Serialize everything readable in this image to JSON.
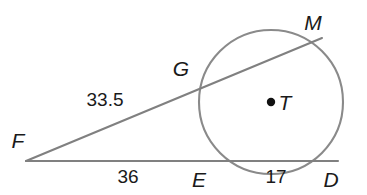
{
  "figure": {
    "type": "geometry-diagram",
    "background_color": "#ffffff",
    "line_color": "#808080",
    "circle_color": "#8a8a8a",
    "label_color": "#1a1a1a",
    "circle": {
      "center_label": "T",
      "center_x": 271,
      "center_y": 102,
      "radius": 72
    },
    "points": [
      {
        "id": "F",
        "label": "F",
        "x": 26,
        "y": 161,
        "label_x": 18,
        "label_y": 148
      },
      {
        "id": "G",
        "label": "G",
        "x": 201,
        "y": 83,
        "label_x": 181,
        "label_y": 76
      },
      {
        "id": "M",
        "label": "M",
        "x": 322,
        "y": 38,
        "label_x": 313,
        "label_y": 30
      },
      {
        "id": "E",
        "label": "E",
        "x": 214,
        "y": 161,
        "label_x": 199,
        "label_y": 187
      },
      {
        "id": "D",
        "label": "D",
        "x": 338,
        "y": 161,
        "label_x": 331,
        "label_y": 187
      },
      {
        "id": "T",
        "label": "T",
        "x": 271,
        "y": 102,
        "label_x": 279,
        "label_y": 110
      }
    ],
    "segments": [
      {
        "id": "FM",
        "from": "F",
        "to": "M",
        "name": "secant-f-m"
      },
      {
        "id": "FD",
        "from": "F",
        "to": "D",
        "name": "secant-f-d"
      }
    ],
    "measures": [
      {
        "id": "FG",
        "value": "33.5",
        "x": 105,
        "y": 106
      },
      {
        "id": "FE",
        "value": "36",
        "x": 128,
        "y": 183
      },
      {
        "id": "ED",
        "value": "17",
        "x": 276,
        "y": 183
      }
    ]
  }
}
